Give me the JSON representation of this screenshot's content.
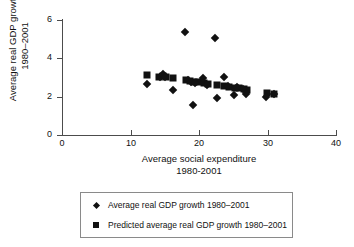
{
  "chart_data": {
    "type": "scatter",
    "title": "",
    "xlabel": "Average social expenditure 1980-2001",
    "xlabel_lines": [
      "Average social expenditure",
      "1980-2001"
    ],
    "ylabel": "Average real GDP growth, 1980–2001",
    "ylabel_lines": [
      "Average real GDP growth,",
      "1980–2001"
    ],
    "xlim": [
      0,
      40
    ],
    "ylim": [
      0,
      6
    ],
    "xticks": [
      0,
      10,
      20,
      30,
      40
    ],
    "yticks": [
      0,
      2,
      4,
      6
    ],
    "grid": false,
    "legend_position": "below-plot",
    "series": [
      {
        "name": "Average real GDP growth 1980–2001",
        "marker": "diamond",
        "color": "#111111",
        "points": [
          [
            12.4,
            2.65
          ],
          [
            14.3,
            3.05
          ],
          [
            14.8,
            3.2
          ],
          [
            15.1,
            3.05
          ],
          [
            16.2,
            2.35
          ],
          [
            17.9,
            5.4
          ],
          [
            18.4,
            2.85
          ],
          [
            18.9,
            2.75
          ],
          [
            19.1,
            1.55
          ],
          [
            19.4,
            2.7
          ],
          [
            20.6,
            2.95
          ],
          [
            21.2,
            2.6
          ],
          [
            22.4,
            5.05
          ],
          [
            22.6,
            1.95
          ],
          [
            23.6,
            3.05
          ],
          [
            24.3,
            2.55
          ],
          [
            25.1,
            2.1
          ],
          [
            25.6,
            2.5
          ],
          [
            26.4,
            2.4
          ],
          [
            26.9,
            2.15
          ],
          [
            29.8,
            2.0
          ],
          [
            30.9,
            2.15
          ]
        ]
      },
      {
        "name": "Predicted average real GDP growth 1980–2001",
        "marker": "square",
        "color": "#111111",
        "points": [
          [
            12.4,
            3.15
          ],
          [
            14.2,
            3.05
          ],
          [
            14.7,
            3.1
          ],
          [
            15.2,
            3.05
          ],
          [
            16.2,
            2.95
          ],
          [
            18.1,
            2.85
          ],
          [
            18.7,
            2.8
          ],
          [
            19.2,
            2.75
          ],
          [
            19.8,
            2.75
          ],
          [
            20.7,
            2.7
          ],
          [
            21.3,
            2.65
          ],
          [
            22.6,
            2.6
          ],
          [
            23.7,
            2.55
          ],
          [
            24.4,
            2.5
          ],
          [
            25.2,
            2.45
          ],
          [
            25.8,
            2.45
          ],
          [
            26.5,
            2.4
          ],
          [
            27.0,
            2.35
          ],
          [
            29.9,
            2.2
          ],
          [
            31.0,
            2.15
          ]
        ]
      }
    ],
    "legend": [
      {
        "marker": "diamond",
        "label": "Average real GDP growth 1980–2001"
      },
      {
        "marker": "square",
        "label": "Predicted average real GDP growth 1980–2001"
      }
    ]
  },
  "axes": {
    "x_tick_labels": [
      "0",
      "10",
      "20",
      "30",
      "40"
    ],
    "y_tick_labels": [
      "0",
      "2",
      "4",
      "6"
    ],
    "x_title_line1": "Average social expenditure",
    "x_title_line2": "1980-2001",
    "y_title_line1": "Average real GDP growth,",
    "y_title_line2": "1980–2001"
  },
  "legend": {
    "actual_label": "Average real GDP growth 1980–2001",
    "predicted_label": "Predicted average real GDP growth 1980–2001"
  },
  "colors": {
    "marker": "#111111",
    "axis": "#4c4c4c",
    "legend_border": "#8a8a8a",
    "background": "#ffffff"
  }
}
